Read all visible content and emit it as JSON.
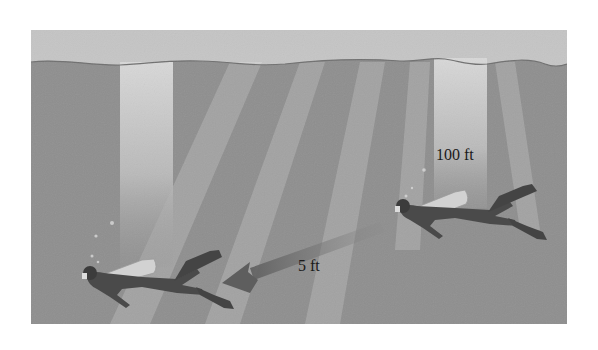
{
  "figure": {
    "labels": {
      "depth": "100 ft",
      "distance": "5 ft"
    },
    "colors": {
      "background": "#ffffff",
      "sky": "#c8c8c8",
      "water": "#8e8e8e",
      "light_shaft": "#bdbdbd",
      "surface_line": "#6e6e6e",
      "diver_suit": "#4a4a4a",
      "diver_tank": "#cfcfcf",
      "arrow": "#6a6a6a"
    },
    "elements": {
      "divers": [
        {
          "name": "diver-right",
          "direction": "left"
        },
        {
          "name": "diver-left",
          "direction": "left"
        }
      ],
      "light_shafts": 2,
      "arrow_direction": "left"
    }
  }
}
